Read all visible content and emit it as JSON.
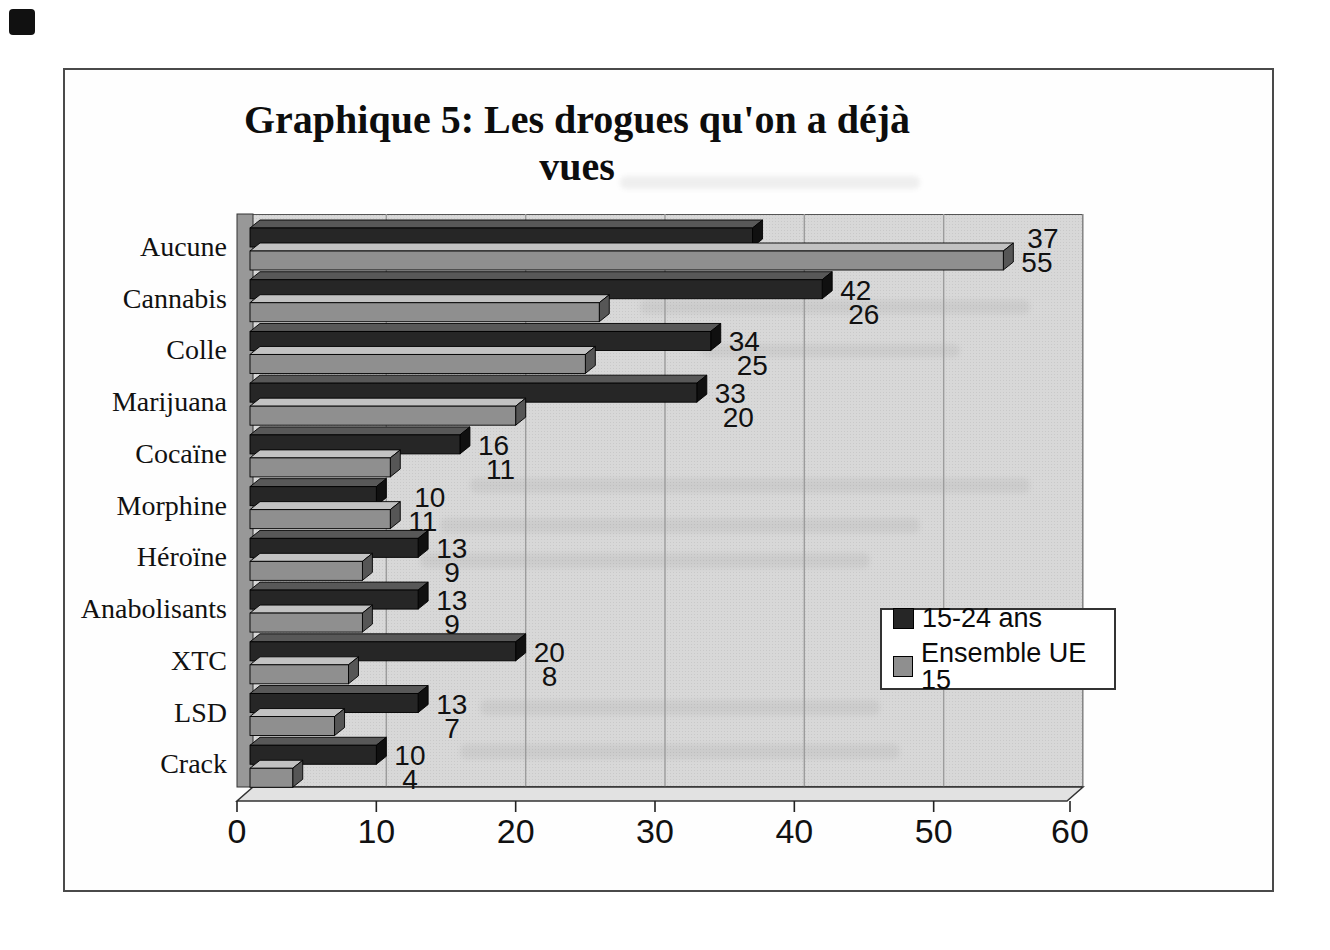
{
  "chart_data": {
    "type": "bar",
    "orientation": "horizontal",
    "title": "Graphique 5: Les drogues qu'on a déjà vues",
    "categories": [
      "Aucune",
      "Cannabis",
      "Colle",
      "Marijuana",
      "Cocaïne",
      "Morphine",
      "Héroïne",
      "Anabolisants",
      "XTC",
      "LSD",
      "Crack"
    ],
    "series": [
      {
        "name": "15-24 ans",
        "color": "#262626",
        "top_color": "#585858",
        "cap_color": "#101010",
        "values": [
          37,
          42,
          34,
          33,
          16,
          10,
          13,
          13,
          20,
          13,
          10
        ]
      },
      {
        "name": "Ensemble UE 15",
        "color": "#8f8f8f",
        "top_color": "#c2c2c2",
        "cap_color": "#565656",
        "values": [
          55,
          26,
          25,
          20,
          11,
          11,
          9,
          9,
          8,
          7,
          4
        ]
      }
    ],
    "x_ticks": [
      "0",
      "10",
      "20",
      "30",
      "40",
      "50",
      "60"
    ],
    "xlim": [
      0,
      60
    ],
    "grid": "vertical",
    "legend_position": "inside-right",
    "data_labels": true
  },
  "style_colors": {
    "plot_background": "#d8d8d8",
    "gridline": "#9c9c9c",
    "wall": "#989898",
    "floor": "#e2e2e2",
    "label_text": "#111111"
  }
}
